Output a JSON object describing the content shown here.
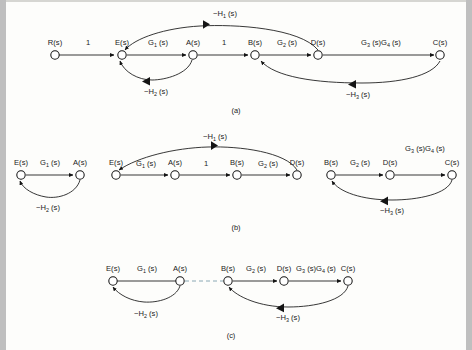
{
  "figure": {
    "type": "signal-flow-graph",
    "captions": [
      "(a)",
      "(b)",
      "(c)"
    ],
    "node_labels": {
      "R": "R(s)",
      "E": "E(s)",
      "A": "A(s)",
      "B": "B(s)",
      "D": "D(s)",
      "C": "C(s)"
    },
    "branch_labels": {
      "unity": "1",
      "G1": "G",
      "G1sub": "1",
      "G1tail": " (s)",
      "G2": "G",
      "G2sub": "2",
      "G2tail": " (s)",
      "G3G4_a": "G",
      "G3G4_sub1": "3",
      "G3G4_mid": " (s)G",
      "G3G4_sub2": "4",
      "G3G4_tail": " (s)",
      "H1": "−H",
      "H1sub": "1",
      "H1tail": " (s)",
      "H2": "−H",
      "H2sub": "2",
      "H2tail": " (s)",
      "H3": "−H",
      "H3sub": "3",
      "H3tail": " (s)"
    }
  },
  "panel_a": {
    "caption": "(a)",
    "nodes": [
      {
        "id": "R",
        "label": "R(s)",
        "x": 55,
        "y": 55
      },
      {
        "id": "E",
        "label": "E(s)",
        "x": 122,
        "y": 55
      },
      {
        "id": "A",
        "label": "A(s)",
        "x": 193,
        "y": 55
      },
      {
        "id": "B",
        "label": "B(s)",
        "x": 255,
        "y": 55
      },
      {
        "id": "D",
        "label": "D(s)",
        "x": 318,
        "y": 55
      },
      {
        "id": "C",
        "label": "C(s)",
        "x": 440,
        "y": 55
      }
    ],
    "edges": [
      {
        "from": "R",
        "to": "E",
        "label": "1",
        "style": "straight",
        "dir": "forward"
      },
      {
        "from": "E",
        "to": "A",
        "label": "G1(s)",
        "style": "straight",
        "dir": "forward"
      },
      {
        "from": "A",
        "to": "B",
        "label": "1",
        "style": "straight",
        "dir": "forward"
      },
      {
        "from": "B",
        "to": "D",
        "label": "G2(s)",
        "style": "straight",
        "dir": "forward"
      },
      {
        "from": "D",
        "to": "C",
        "label": "G3(s)G4(s)",
        "style": "straight",
        "dir": "forward"
      },
      {
        "from": "D",
        "to": "E",
        "label": "-H1(s)",
        "style": "arc-above",
        "dir": "backward"
      },
      {
        "from": "A",
        "to": "E",
        "label": "-H2(s)",
        "style": "arc-below",
        "dir": "backward"
      },
      {
        "from": "C",
        "to": "B",
        "label": "-H3(s)",
        "style": "arc-below",
        "dir": "backward"
      }
    ]
  },
  "panel_b": {
    "caption": "(b)",
    "groups": [
      {
        "name": "loop-1",
        "nodes": [
          {
            "id": "E",
            "label": "E(s)",
            "x": 21,
            "y": 175
          },
          {
            "id": "A",
            "label": "A(s)",
            "x": 80,
            "y": 175
          }
        ],
        "edges": [
          {
            "from": "E",
            "to": "A",
            "label": "G1(s)",
            "style": "straight",
            "dir": "forward"
          },
          {
            "from": "A",
            "to": "E",
            "label": "-H2(s)",
            "style": "arc-below",
            "dir": "backward"
          }
        ]
      },
      {
        "name": "loop-2",
        "nodes": [
          {
            "id": "E",
            "label": "E(s)",
            "x": 116,
            "y": 175
          },
          {
            "id": "A",
            "label": "A(s)",
            "x": 175,
            "y": 175
          },
          {
            "id": "B",
            "label": "B(s)",
            "x": 237,
            "y": 175
          },
          {
            "id": "D",
            "label": "D(s)",
            "x": 297,
            "y": 175
          }
        ],
        "edges": [
          {
            "from": "E",
            "to": "A",
            "label": "G1(s)",
            "style": "straight",
            "dir": "forward"
          },
          {
            "from": "A",
            "to": "B",
            "label": "1",
            "style": "straight",
            "dir": "forward"
          },
          {
            "from": "B",
            "to": "D",
            "label": "G2(s)",
            "style": "straight",
            "dir": "forward"
          },
          {
            "from": "D",
            "to": "E",
            "label": "-H1(s)",
            "style": "arc-above",
            "dir": "backward"
          }
        ]
      },
      {
        "name": "loop-3",
        "nodes": [
          {
            "id": "B",
            "label": "B(s)",
            "x": 331,
            "y": 175
          },
          {
            "id": "D",
            "label": "D(s)",
            "x": 390,
            "y": 175
          },
          {
            "id": "C",
            "label": "C(s)",
            "x": 452,
            "y": 175
          }
        ],
        "edges": [
          {
            "from": "B",
            "to": "D",
            "label": "G2(s)",
            "style": "straight",
            "dir": "forward"
          },
          {
            "from": "D",
            "to": "C",
            "label": "G3(s)G4(s)",
            "style": "straight",
            "dir": "forward"
          },
          {
            "from": "C",
            "to": "B",
            "label": "-H3(s)",
            "style": "arc-below",
            "dir": "backward"
          }
        ]
      }
    ]
  },
  "panel_c": {
    "caption": "(c)",
    "nodes": [
      {
        "id": "E",
        "label": "E(s)",
        "x": 113,
        "y": 281
      },
      {
        "id": "A",
        "label": "A(s)",
        "x": 180,
        "y": 281
      },
      {
        "id": "B",
        "label": "B(s)",
        "x": 228,
        "y": 281
      },
      {
        "id": "D",
        "label": "D(s)",
        "x": 284,
        "y": 281
      },
      {
        "id": "C",
        "label": "C(s)",
        "x": 348,
        "y": 281
      }
    ],
    "edges": [
      {
        "from": "E",
        "to": "A",
        "label": "G1(s)",
        "style": "straight",
        "dir": "none"
      },
      {
        "from": "A",
        "to": "B",
        "label": "",
        "style": "dashed",
        "dir": "none"
      },
      {
        "from": "B",
        "to": "D",
        "label": "G2(s)",
        "style": "straight",
        "dir": "forward"
      },
      {
        "from": "D",
        "to": "C",
        "label": "G3(s)G4(s)",
        "style": "straight",
        "dir": "forward"
      },
      {
        "from": "A",
        "to": "E",
        "label": "-H2(s)",
        "style": "arc-below",
        "dir": "backward"
      },
      {
        "from": "C",
        "to": "B",
        "label": "-H3(s)",
        "style": "arc-below",
        "dir": "backward"
      }
    ]
  }
}
